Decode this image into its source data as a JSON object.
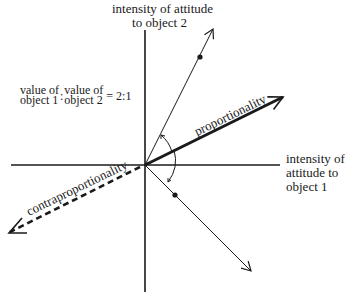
{
  "diagram": {
    "y_axis_label": [
      "intensity of attitude",
      "to object 2"
    ],
    "x_axis_label": [
      "intensity of",
      "attitude to",
      "object 1"
    ],
    "ratio_label": {
      "top_left": "value of",
      "bottom_left": "object 1",
      "top_right": "value of",
      "bottom_right": "object 2",
      "separator": ":",
      "equals": "= 2:1"
    },
    "proportionality_label": "proportionality",
    "contraproportionality_label": "contraproportionality",
    "colors": {
      "ink": "#1a1a1a",
      "background": "#ffffff"
    }
  }
}
